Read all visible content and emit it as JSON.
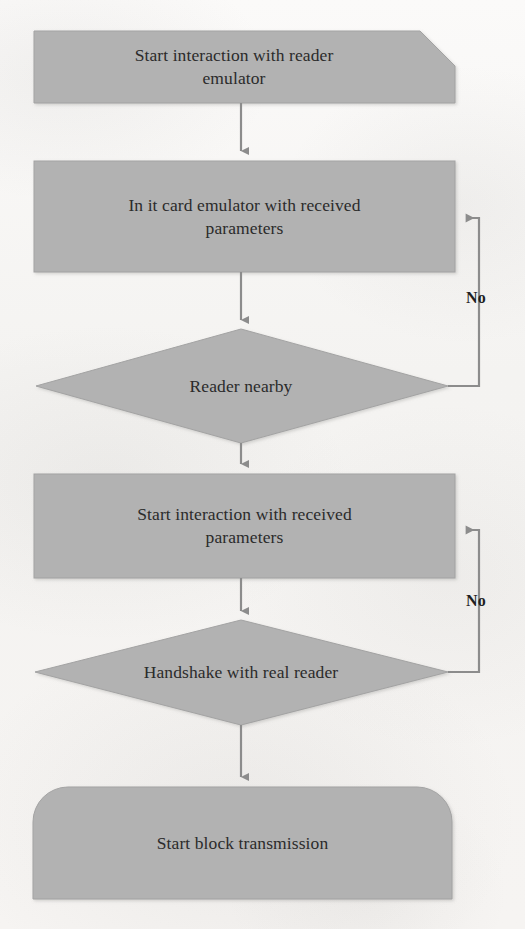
{
  "diagram": {
    "colors": {
      "shape_fill": "#b2b2b2",
      "shape_stroke": "#9a9a9a",
      "connector": "#8c8c8c",
      "text": "#2b2b2b",
      "background": "#f6f4f2"
    },
    "nodes": [
      {
        "id": "start-interaction-reader-emulator",
        "shape": "clipped-corner-box",
        "label": "Start interaction with reader\nemulator"
      },
      {
        "id": "init-card-emulator",
        "shape": "rectangle",
        "label": "In it card emulator with received\nparameters"
      },
      {
        "id": "reader-nearby",
        "shape": "diamond",
        "label": "Reader nearby"
      },
      {
        "id": "start-interaction-received-parameters",
        "shape": "rectangle",
        "label": "Start interaction with received\nparameters"
      },
      {
        "id": "handshake-real-reader",
        "shape": "diamond",
        "label": "Handshake with real reader"
      },
      {
        "id": "start-block-transmission",
        "shape": "rounded-top-box",
        "label": "Start block transmission"
      }
    ],
    "edges": [
      {
        "id": "edge-start-to-init",
        "from": "start-interaction-reader-emulator",
        "to": "init-card-emulator",
        "label": ""
      },
      {
        "id": "edge-init-to-reader-nearby",
        "from": "init-card-emulator",
        "to": "reader-nearby",
        "label": ""
      },
      {
        "id": "edge-reader-nearby-no",
        "from": "reader-nearby",
        "to": "init-card-emulator",
        "label": "No"
      },
      {
        "id": "edge-reader-nearby-yes",
        "from": "reader-nearby",
        "to": "start-interaction-received-parameters",
        "label": ""
      },
      {
        "id": "edge-params-to-handshake",
        "from": "start-interaction-received-parameters",
        "to": "handshake-real-reader",
        "label": ""
      },
      {
        "id": "edge-handshake-no",
        "from": "handshake-real-reader",
        "to": "start-interaction-received-parameters",
        "label": "No"
      },
      {
        "id": "edge-handshake-yes",
        "from": "handshake-real-reader",
        "to": "start-block-transmission",
        "label": ""
      }
    ],
    "edge_labels": {
      "no_reader_nearby": "No",
      "no_handshake": "No"
    }
  }
}
